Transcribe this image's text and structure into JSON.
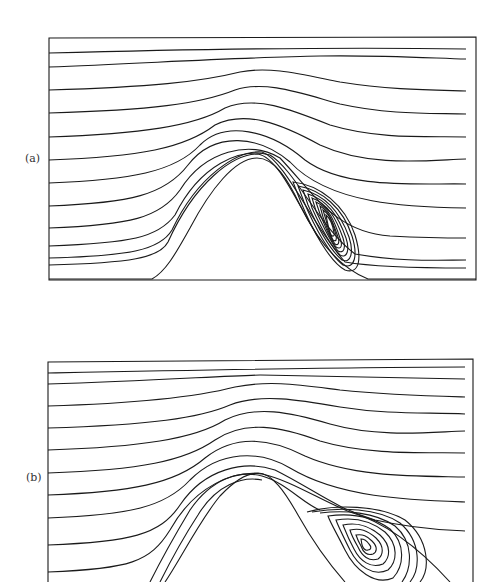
{
  "figure": {
    "panels": [
      {
        "id": "a",
        "label": "(a)",
        "description": "Streamlines of flow over a hill with a thin elongated recirculation vortex on the lee side"
      },
      {
        "id": "b",
        "label": "(b)",
        "description": "Streamlines of flow over a hill with a larger, rounder recirculation vortex on the lee side"
      }
    ],
    "colors": {
      "line": "#1a1a1a",
      "background": "#ffffff"
    }
  }
}
